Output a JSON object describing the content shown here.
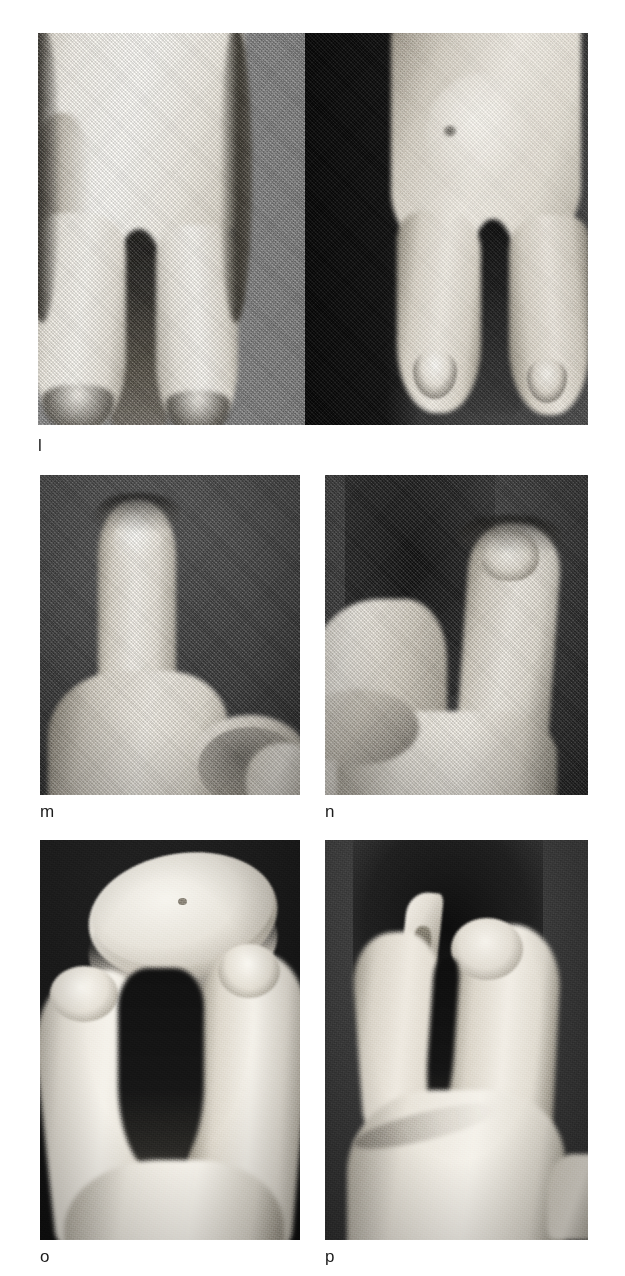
{
  "figure": {
    "kind": "clinical-photograph-plate",
    "background_color": "#ffffff",
    "width": 625,
    "height": 1276,
    "rows": 3,
    "columns": 2,
    "panel_count": 5,
    "panels": [
      {
        "id": "panel-l-left",
        "caption": "l",
        "caption_shown": true,
        "position": {
          "x": 38,
          "y": 33,
          "width": 267,
          "height": 392
        },
        "background_color": "#8d8d8d",
        "background_description": "flat mid-grey cloth",
        "subject": "dorsal view of hand with central cleft between two broad digits",
        "skin_color": "#f2efe8",
        "shadow_color": "#2a2a2a"
      },
      {
        "id": "panel-l-right",
        "caption": "",
        "caption_shown": false,
        "position": {
          "x": 305,
          "y": 33,
          "width": 283,
          "height": 392
        },
        "background_color": "#141414",
        "background_description": "dark cloth, graded lighter toward lower right",
        "subject": "dorsal view of opposite hand with central cleft, nails visible on digit tips",
        "skin_color": "#e9e4da",
        "shadow_color": "#1a1a1a"
      },
      {
        "id": "panel-m",
        "caption": "m",
        "caption_shown": true,
        "position": {
          "x": 40,
          "y": 475,
          "width": 260,
          "height": 320
        },
        "background_color": "#4a4a4a",
        "background_description": "dark denim weave",
        "subject": "close-up of single broad digit held upright, jar lid rim at lower right",
        "skin_color": "#eeeae1",
        "shadow_color": "#222222"
      },
      {
        "id": "panel-n",
        "caption": "n",
        "caption_shown": true,
        "position": {
          "x": 325,
          "y": 475,
          "width": 263,
          "height": 320
        },
        "background_color": "#3f3f3f",
        "background_description": "dark denim weave",
        "subject": "close-up of curved digit with irregular nail, thumb and lid at lower left",
        "skin_color": "#e7e2d8",
        "shadow_color": "#1e1e1e"
      },
      {
        "id": "panel-o",
        "caption": "o",
        "caption_shown": true,
        "position": {
          "x": 40,
          "y": 840,
          "width": 260,
          "height": 400
        },
        "background_color": "#171717",
        "background_description": "black cloth",
        "subject": "hand grasping a circular jar lid between the two cleft digits",
        "skin_color": "#f0ece3",
        "shadow_color": "#0e0e0e"
      },
      {
        "id": "panel-p",
        "caption": "p",
        "caption_shown": true,
        "position": {
          "x": 325,
          "y": 840,
          "width": 263,
          "height": 400
        },
        "background_color": "#3a3a3a",
        "background_description": "dark grey cloth with darker central block",
        "subject": "hand pinching a small flat key-like object between digit tips",
        "skin_color": "#e6e1d7",
        "shadow_color": "#141414"
      }
    ],
    "captions": [
      {
        "label": "l",
        "x": 38,
        "y": 437
      },
      {
        "label": "m",
        "x": 40,
        "y": 803
      },
      {
        "label": "n",
        "x": 325,
        "y": 803
      },
      {
        "label": "o",
        "x": 40,
        "y": 1248
      },
      {
        "label": "p",
        "x": 325,
        "y": 1248
      }
    ]
  }
}
